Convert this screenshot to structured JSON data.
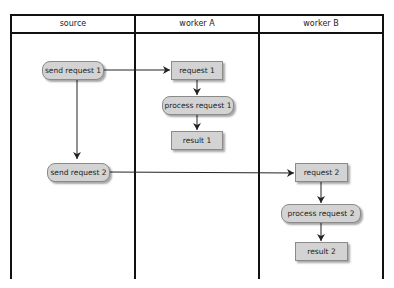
{
  "lanes": [
    {
      "label": "source"
    },
    {
      "label": "worker A"
    },
    {
      "label": "worker B"
    }
  ],
  "nodes": {
    "send_request_1": "send request 1",
    "send_request_2": "send request 2",
    "request_1": "request 1",
    "process_request_1": "process request 1",
    "result_1": "result 1",
    "request_2": "request 2",
    "process_request_2": "process request 2",
    "result_2": "result 2"
  },
  "colors": {
    "node_fill": "#d3d3d3",
    "border": "#111111"
  }
}
